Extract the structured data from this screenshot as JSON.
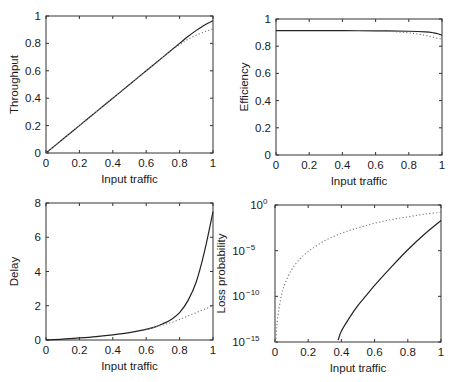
{
  "figure": {
    "width": 452,
    "height": 382,
    "colors": {
      "solid_line": "#222222",
      "dotted_line": "#777777",
      "axes": "#333333",
      "background": "#ffffff"
    }
  },
  "chart_data": [
    {
      "id": "throughput",
      "type": "line",
      "title": "",
      "xlabel": "Input traffic",
      "ylabel": "Throughput",
      "xlim": [
        0,
        1
      ],
      "ylim": [
        0,
        1
      ],
      "yscale": "linear",
      "xticks": [
        "0",
        "0.2",
        "0.4",
        "0.6",
        "0.8",
        "1"
      ],
      "yticks": [
        "0",
        "0.2",
        "0.4",
        "0.6",
        "0.8",
        "1"
      ],
      "grid": false,
      "legend": null,
      "box": {
        "left": 46,
        "top": 16,
        "right": 213,
        "bottom": 153
      },
      "series": [
        {
          "name": "solid",
          "style": "solid",
          "x": [
            0,
            0.1,
            0.2,
            0.3,
            0.4,
            0.5,
            0.6,
            0.7,
            0.8,
            0.85,
            0.9,
            0.95,
            1.0
          ],
          "y": [
            0,
            0.1,
            0.2,
            0.3,
            0.4,
            0.5,
            0.6,
            0.7,
            0.8,
            0.85,
            0.895,
            0.935,
            0.965
          ]
        },
        {
          "name": "dotted",
          "style": "dotted",
          "x": [
            0,
            0.1,
            0.2,
            0.3,
            0.4,
            0.5,
            0.6,
            0.7,
            0.75,
            0.8,
            0.85,
            0.9,
            0.95,
            1.0
          ],
          "y": [
            0,
            0.1,
            0.2,
            0.3,
            0.4,
            0.5,
            0.6,
            0.7,
            0.75,
            0.79,
            0.83,
            0.86,
            0.885,
            0.905
          ]
        }
      ]
    },
    {
      "id": "efficiency",
      "type": "line",
      "title": "",
      "xlabel": "Input traffic",
      "ylabel": "Efficiency",
      "xlim": [
        0,
        1
      ],
      "ylim": [
        0,
        1
      ],
      "yscale": "linear",
      "xticks": [
        "0",
        "0.2",
        "0.4",
        "0.6",
        "0.8",
        "1"
      ],
      "yticks": [
        "0",
        "0.2",
        "0.4",
        "0.6",
        "0.8",
        "1"
      ],
      "grid": false,
      "legend": null,
      "box": {
        "left": 276,
        "top": 19,
        "right": 442,
        "bottom": 155
      },
      "series": [
        {
          "name": "solid",
          "style": "solid",
          "x": [
            0,
            0.2,
            0.4,
            0.6,
            0.8,
            0.9,
            0.95,
            0.98,
            1.0
          ],
          "y": [
            0.915,
            0.915,
            0.914,
            0.913,
            0.91,
            0.905,
            0.898,
            0.89,
            0.88
          ]
        },
        {
          "name": "dotted",
          "style": "dotted",
          "x": [
            0.6,
            0.7,
            0.8,
            0.85,
            0.9,
            0.95,
            1.0
          ],
          "y": [
            0.913,
            0.908,
            0.898,
            0.89,
            0.878,
            0.865,
            0.85
          ]
        }
      ]
    },
    {
      "id": "delay",
      "type": "line",
      "title": "",
      "xlabel": "Input traffic",
      "ylabel": "Delay",
      "xlim": [
        0,
        1
      ],
      "ylim": [
        0,
        8
      ],
      "yscale": "linear",
      "xticks": [
        "0",
        "0.2",
        "0.4",
        "0.6",
        "0.8",
        "1"
      ],
      "yticks": [
        "0",
        "2",
        "4",
        "6",
        "8"
      ],
      "grid": false,
      "legend": null,
      "box": {
        "left": 46,
        "top": 203,
        "right": 213,
        "bottom": 340
      },
      "series": [
        {
          "name": "solid",
          "style": "solid",
          "x": [
            0,
            0.1,
            0.2,
            0.3,
            0.4,
            0.5,
            0.6,
            0.65,
            0.7,
            0.75,
            0.8,
            0.85,
            0.9,
            0.95,
            1.0
          ],
          "y": [
            0,
            0.05,
            0.12,
            0.2,
            0.3,
            0.43,
            0.62,
            0.75,
            0.95,
            1.2,
            1.6,
            2.3,
            3.4,
            5.2,
            7.5
          ]
        },
        {
          "name": "dotted",
          "style": "dotted",
          "x": [
            0.6,
            0.65,
            0.7,
            0.75,
            0.8,
            0.85,
            0.9,
            0.95,
            1.0
          ],
          "y": [
            0.62,
            0.74,
            0.88,
            1.02,
            1.2,
            1.4,
            1.6,
            1.8,
            2.0
          ]
        }
      ]
    },
    {
      "id": "loss_probability",
      "type": "line",
      "title": "",
      "xlabel": "Input traffic",
      "ylabel": "Loss probability",
      "xlim": [
        0,
        1
      ],
      "ylim": [
        1e-15,
        1
      ],
      "yscale": "log",
      "xticks": [
        "0",
        "0.2",
        "0.4",
        "0.6",
        "0.8",
        "1"
      ],
      "yticks": [
        {
          "base": "10",
          "exp": "-15"
        },
        {
          "base": "10",
          "exp": "-10"
        },
        {
          "base": "10",
          "exp": "-5"
        },
        {
          "base": "10",
          "exp": "0"
        }
      ],
      "grid": false,
      "legend": null,
      "box": {
        "left": 275,
        "top": 205,
        "right": 441,
        "bottom": 342
      },
      "series": [
        {
          "name": "solid",
          "style": "solid",
          "x": [
            0.38,
            0.4,
            0.45,
            0.5,
            0.55,
            0.6,
            0.7,
            0.8,
            0.9,
            1.0
          ],
          "log10_y": [
            -14.8,
            -13.8,
            -12.3,
            -11.0,
            -9.9,
            -8.8,
            -6.8,
            -4.9,
            -3.2,
            -1.7
          ]
        },
        {
          "name": "dotted",
          "style": "dotted",
          "x": [
            0.005,
            0.01,
            0.02,
            0.04,
            0.06,
            0.1,
            0.15,
            0.2,
            0.3,
            0.4,
            0.5,
            0.6,
            0.7,
            0.8,
            0.9,
            1.0
          ],
          "log10_y": [
            -15,
            -13.5,
            -11.8,
            -9.8,
            -8.6,
            -7.1,
            -5.9,
            -5.1,
            -3.9,
            -3.1,
            -2.5,
            -2.0,
            -1.6,
            -1.3,
            -1.0,
            -0.8
          ]
        }
      ]
    }
  ]
}
